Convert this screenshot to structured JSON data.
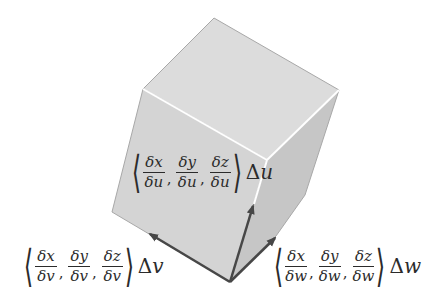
{
  "figure": {
    "colors": {
      "top_face": "#dcdcdc",
      "left_face": "#d4d4d4",
      "right_face": "#c4c4c4",
      "highlight_edge": "#ffffff",
      "outline": "#9a9a9a",
      "arrow": "#474747",
      "text": "#2b2b2b"
    },
    "vectors": [
      {
        "id": "u",
        "numerators": [
          "δx",
          "δy",
          "δz"
        ],
        "denominator": "δu",
        "multiplier": "Δ",
        "variable": "u"
      },
      {
        "id": "v",
        "numerators": [
          "δx",
          "δy",
          "δz"
        ],
        "denominator": "δv",
        "multiplier": "Δ",
        "variable": "v"
      },
      {
        "id": "w",
        "numerators": [
          "δx",
          "δy",
          "δz"
        ],
        "denominator": "δw",
        "multiplier": "Δ",
        "variable": "w"
      }
    ],
    "brackets": {
      "open": "⟨",
      "close": "⟩",
      "comma": ","
    }
  }
}
